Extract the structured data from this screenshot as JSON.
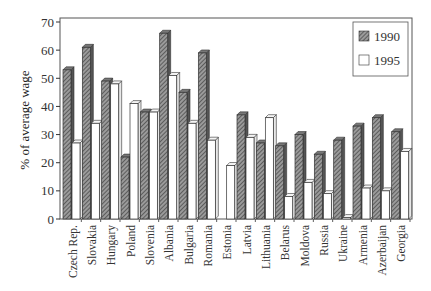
{
  "chart_data": {
    "type": "bar",
    "title": "",
    "xlabel": "",
    "ylabel": "% of average wage",
    "ylim": [
      0,
      70
    ],
    "yticks": [
      0,
      10,
      20,
      30,
      40,
      50,
      60,
      70
    ],
    "grid": false,
    "legend_position": "upper right",
    "style": "3D bars; 1990 hatched dark gray, 1995 white",
    "categories": [
      "Czech Rep.",
      "Slovakia",
      "Hungary",
      "Poland",
      "Slovenia",
      "Albania",
      "Bulgaria",
      "Romania",
      "Estonia",
      "Latvia",
      "Lithuania",
      "Belarus",
      "Moldova",
      "Russia",
      "Ukraine",
      "Armenia",
      "Azerbaijan",
      "Georgia"
    ],
    "series": [
      {
        "name": "1990",
        "values": [
          53,
          61,
          49,
          22,
          38,
          66,
          45,
          59,
          null,
          37,
          27,
          26,
          30,
          23,
          28,
          33,
          36,
          31
        ]
      },
      {
        "name": "1995",
        "values": [
          27,
          34,
          48,
          41,
          38,
          51,
          34,
          28,
          19,
          29,
          36,
          8,
          13,
          9,
          0.5,
          11,
          10,
          24
        ]
      }
    ]
  },
  "colors": {
    "series_1990": "#6f6f6f",
    "series_1995": "#ffffff",
    "axis": "#333333"
  },
  "legend": {
    "items": [
      {
        "label": "1990"
      },
      {
        "label": "1995"
      }
    ]
  },
  "axis": {
    "ylabel": "% of average wage"
  }
}
